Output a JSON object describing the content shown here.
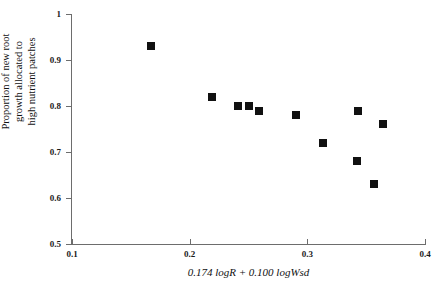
{
  "chart_data": {
    "type": "scatter",
    "title": "",
    "xlabel": "0.174 logR + 0.100 logWsd",
    "ylabel_lines": [
      "Proportion of new root",
      "growth allocated to",
      "high nutrient patches"
    ],
    "xlim": [
      0.1,
      0.4
    ],
    "ylim": [
      0.5,
      1.0
    ],
    "xticks": [
      0.1,
      0.2,
      0.3,
      0.4
    ],
    "xtick_labels": [
      "0.1",
      "0.2",
      "0.3",
      "0.4"
    ],
    "yticks": [
      0.5,
      0.6,
      0.7,
      0.8,
      0.9,
      1.0
    ],
    "ytick_labels": [
      "0.5",
      "0.6",
      "0.7",
      "0.8",
      "0.9",
      "1"
    ],
    "grid": false,
    "legend": null,
    "marker": "filled-square",
    "marker_color": "#111111",
    "axis_color": "#6d6d6d",
    "points": [
      {
        "x": 0.167,
        "y": 0.93
      },
      {
        "x": 0.219,
        "y": 0.82
      },
      {
        "x": 0.241,
        "y": 0.8
      },
      {
        "x": 0.25,
        "y": 0.8
      },
      {
        "x": 0.259,
        "y": 0.79
      },
      {
        "x": 0.29,
        "y": 0.78
      },
      {
        "x": 0.313,
        "y": 0.72
      },
      {
        "x": 0.343,
        "y": 0.79
      },
      {
        "x": 0.364,
        "y": 0.76
      },
      {
        "x": 0.342,
        "y": 0.68
      },
      {
        "x": 0.357,
        "y": 0.63
      }
    ]
  }
}
